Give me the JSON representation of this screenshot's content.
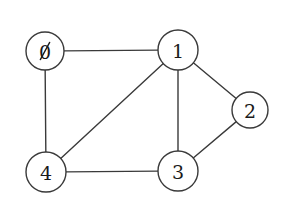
{
  "figure": {
    "background_color": "#ffffff",
    "stroke_color": "#3a3a3a",
    "label_color": "#1a1a1a",
    "node_fill_color": "#ffffff",
    "width": 284,
    "height": 207
  },
  "graph": {
    "type": "undirected",
    "node_count": 5,
    "edge_count": 7,
    "nodes": [
      {
        "id": "0",
        "label": "0",
        "cx": 45,
        "cy": 51,
        "r": 19,
        "glyph_style": "slashed-zero",
        "degree": 2
      },
      {
        "id": "1",
        "label": "1",
        "cx": 178,
        "cy": 50,
        "r": 20,
        "glyph_style": "plain",
        "degree": 4
      },
      {
        "id": "2",
        "label": "2",
        "cx": 250,
        "cy": 110,
        "r": 18,
        "glyph_style": "plain",
        "degree": 2
      },
      {
        "id": "3",
        "label": "3",
        "cx": 178,
        "cy": 171,
        "r": 20,
        "glyph_style": "plain",
        "degree": 3
      },
      {
        "id": "4",
        "label": "4",
        "cx": 46,
        "cy": 172,
        "r": 20,
        "glyph_style": "plain",
        "degree": 3
      }
    ],
    "edges": [
      {
        "id": "edge-0-1",
        "source": "0",
        "target": "1",
        "orientation": "horizontal"
      },
      {
        "id": "edge-0-4",
        "source": "0",
        "target": "4",
        "orientation": "vertical"
      },
      {
        "id": "edge-1-2",
        "source": "1",
        "target": "2",
        "orientation": "diagonal"
      },
      {
        "id": "edge-1-3",
        "source": "1",
        "target": "3",
        "orientation": "vertical"
      },
      {
        "id": "edge-1-4",
        "source": "1",
        "target": "4",
        "orientation": "diagonal"
      },
      {
        "id": "edge-2-3",
        "source": "2",
        "target": "3",
        "orientation": "diagonal"
      },
      {
        "id": "edge-3-4",
        "source": "3",
        "target": "4",
        "orientation": "horizontal"
      }
    ]
  }
}
